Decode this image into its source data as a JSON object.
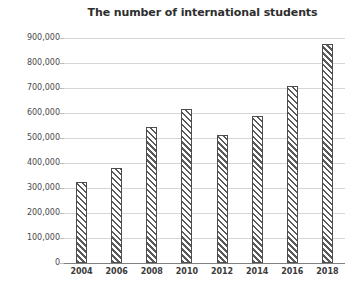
{
  "chart_data": {
    "type": "bar",
    "title": "The number of international students",
    "xlabel": "",
    "ylabel": "",
    "categories": [
      "2004",
      "2006",
      "2008",
      "2010",
      "2012",
      "2014",
      "2016",
      "2018"
    ],
    "values": [
      325000,
      380000,
      543000,
      615000,
      512000,
      587000,
      710000,
      875000
    ],
    "ylim": [
      0,
      900000
    ],
    "ytick_values": [
      0,
      100000,
      200000,
      300000,
      400000,
      500000,
      600000,
      700000,
      800000,
      900000
    ],
    "ytick_labels": [
      "0",
      "100,000",
      "200,000",
      "300,000",
      "400,000",
      "500,000",
      "600,000",
      "700,000",
      "800,000",
      "900,000"
    ],
    "grid": true,
    "legend": null,
    "series_fill": "diagonal-hatch",
    "colors": {
      "hatch": "#5a5a5a",
      "bar_border": "#4d4d4d",
      "bar_background": "#ffffff",
      "gridline": "#d6d6d6",
      "axis": "#808080",
      "title_text": "#2e2e2e",
      "tick_text": "#4a4a4a",
      "background": "#ffffff"
    }
  }
}
